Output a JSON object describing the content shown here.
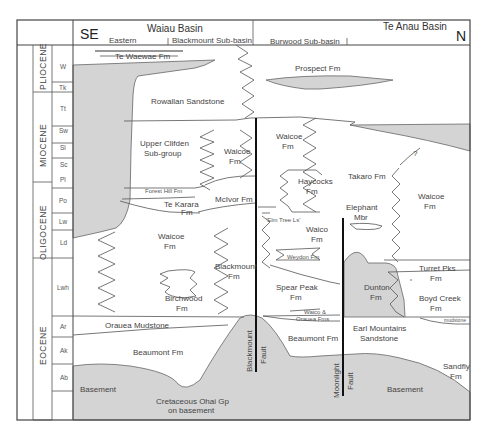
{
  "header": {
    "left_direction": "SE",
    "right_direction": "N",
    "basin_left": "Waiau Basin",
    "basin_right": "Te Anau Basin",
    "subbasins": [
      "Eastern",
      "Blackmount Sub-basin",
      "Burwood Sub-basin"
    ]
  },
  "epochs": [
    {
      "label": "PLIOCENE"
    },
    {
      "label": "MIOCENE"
    },
    {
      "label": "OLIGOCENE"
    },
    {
      "label": "EOCENE"
    }
  ],
  "stages": [
    "W",
    "Tk",
    "Tt",
    "Sw",
    "Sl",
    "Sc",
    "Pl",
    "Po",
    "Lw",
    "Ld",
    "Lwh",
    "Ar",
    "Ak",
    "Ab"
  ],
  "formations": {
    "te_waewae": "Te Waewae Fm",
    "prospect": "Prospect Fm",
    "rowallan": "Rowallan Sandstone",
    "upper_clifden_1": "Upper Clifden",
    "upper_clifden_2": "Sub-group",
    "waicoe_1": "Waicoe",
    "fm": "Fm",
    "forest_hill": "Forest Hill Fm",
    "te_karara_1": "Te Karara",
    "mcivor": "McIvor Fm",
    "haycocks": "Haycocks",
    "takaro": "Takaro Fm",
    "question": "?",
    "elephant_1": "Elephant",
    "elephant_2": "Mbr",
    "elm_tree": "'Elm Tree Ls'",
    "waico": "Waico",
    "weydon": "Weydon Fm",
    "blackmount": "Blackmount",
    "birchwood": "Birchwood",
    "spear_peak": "Spear Peak",
    "dunton": "Dunton",
    "turret_pks": "Turret Pks",
    "boyd_creek": "Boyd Creek",
    "mudstone": "mudstone",
    "waico_orauea_1": "Waico &",
    "waico_orauea_2": "Orauea Fms",
    "orauea": "Orauea Mudstone",
    "earl_1": "Earl Mountains",
    "earl_2": "Sandstone",
    "beaumont": "Beaumont Fm",
    "basement": "Basement",
    "ohai_1": "Cretaceous Ohai Gp",
    "ohai_2": "on basement",
    "sandfly": "Sandfly"
  },
  "faults": {
    "blackmount_1": "Blackmount",
    "blackmount_2": "Fault",
    "moonlight_1": "Moonlight",
    "moonlight_2": "Fault"
  },
  "colors": {
    "fill_grey": "#d4d4d4",
    "line": "#555555",
    "fault": "#111111"
  }
}
